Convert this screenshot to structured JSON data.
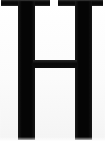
{
  "image": {
    "kind": "scanned-glyph",
    "character": "H",
    "description": "Scanned serif capital letter H, cropped at the baseline",
    "width_px": 105,
    "height_px": 142,
    "background_color": "#fdfdfd",
    "ink_color": "#0a0a0a"
  },
  "glyph": {
    "letter": "H",
    "style": "serif",
    "case": "uppercase",
    "parts": {
      "serif_top_left": {
        "label": "top-left serif",
        "x": 1,
        "y": 0,
        "width": 49,
        "height": 6
      },
      "serif_top_right": {
        "label": "top-right serif",
        "x": 58,
        "y": 0,
        "width": 45,
        "height": 6
      },
      "stem_left": {
        "label": "left stem",
        "x": 18,
        "y": 1,
        "width": 17,
        "height": 139
      },
      "stem_right": {
        "label": "right stem",
        "x": 75,
        "y": 1,
        "width": 17,
        "height": 139
      },
      "crossbar": {
        "label": "crossbar",
        "x": 33,
        "y": 60,
        "width": 44,
        "height": 8
      }
    },
    "serif_gap": {
      "x_start": 50,
      "x_end": 58
    },
    "cropped_edges": [
      "top",
      "bottom",
      "left",
      "right"
    ]
  }
}
